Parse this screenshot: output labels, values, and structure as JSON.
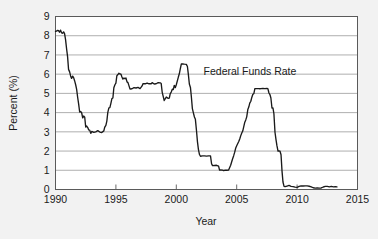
{
  "chart_data": {
    "type": "line",
    "title": "",
    "subtitle": "",
    "xlabel": "Year",
    "ylabel": "Percent (%)",
    "xlim": [
      1990,
      2015
    ],
    "ylim": [
      0,
      9
    ],
    "grid": true,
    "grid_axis": "y",
    "legend": "none",
    "annotations": [
      {
        "text": "Federal Funds Rate",
        "x": 2006.1,
        "y": 5.95
      }
    ],
    "xticks": [
      1990,
      1995,
      2000,
      2005,
      2010,
      2015
    ],
    "xtick_labels": [
      "1990",
      "1995",
      "2000",
      "2005",
      "2010",
      "2015"
    ],
    "yticks": [
      0,
      1,
      2,
      3,
      4,
      5,
      6,
      7,
      8,
      9
    ],
    "ytick_labels": [
      "0",
      "1",
      "2",
      "3",
      "4",
      "5",
      "6",
      "7",
      "8",
      "9"
    ],
    "series": [
      {
        "name": "Federal Funds Rate",
        "color": "#1a1a1a",
        "x": [
          1990.0,
          1990.08,
          1990.17,
          1990.25,
          1990.33,
          1990.42,
          1990.5,
          1990.58,
          1990.67,
          1990.75,
          1990.83,
          1990.92,
          1991.0,
          1991.08,
          1991.17,
          1991.25,
          1991.33,
          1991.42,
          1991.5,
          1991.58,
          1991.67,
          1991.75,
          1991.83,
          1991.92,
          1992.0,
          1992.08,
          1992.17,
          1992.25,
          1992.33,
          1992.42,
          1992.5,
          1992.58,
          1992.67,
          1992.75,
          1992.83,
          1992.92,
          1993.0,
          1993.17,
          1993.33,
          1993.5,
          1993.67,
          1993.83,
          1994.0,
          1994.08,
          1994.17,
          1994.25,
          1994.33,
          1994.42,
          1994.5,
          1994.58,
          1994.67,
          1994.75,
          1994.83,
          1994.92,
          1995.0,
          1995.08,
          1995.17,
          1995.25,
          1995.33,
          1995.42,
          1995.5,
          1995.58,
          1995.67,
          1995.75,
          1995.83,
          1995.92,
          1996.0,
          1996.17,
          1996.33,
          1996.5,
          1996.67,
          1996.83,
          1997.0,
          1997.17,
          1997.25,
          1997.42,
          1997.58,
          1997.75,
          1997.92,
          1998.0,
          1998.17,
          1998.33,
          1998.5,
          1998.67,
          1998.75,
          1998.83,
          1998.92,
          1999.0,
          1999.17,
          1999.33,
          1999.42,
          1999.5,
          1999.58,
          1999.67,
          1999.75,
          1999.83,
          1999.92,
          2000.0,
          2000.17,
          2000.25,
          2000.33,
          2000.42,
          2000.5,
          2000.67,
          2000.83,
          2000.92,
          2001.0,
          2001.08,
          2001.17,
          2001.25,
          2001.33,
          2001.42,
          2001.5,
          2001.58,
          2001.67,
          2001.75,
          2001.83,
          2001.92,
          2002.0,
          2002.17,
          2002.33,
          2002.5,
          2002.67,
          2002.83,
          2002.92,
          2003.0,
          2003.17,
          2003.33,
          2003.5,
          2003.58,
          2003.67,
          2003.83,
          2003.92,
          2004.0,
          2004.17,
          2004.33,
          2004.5,
          2004.58,
          2004.67,
          2004.75,
          2004.83,
          2004.92,
          2005.0,
          2005.17,
          2005.25,
          2005.33,
          2005.42,
          2005.5,
          2005.58,
          2005.67,
          2005.75,
          2005.83,
          2005.92,
          2006.0,
          2006.08,
          2006.17,
          2006.25,
          2006.33,
          2006.42,
          2006.5,
          2006.58,
          2006.67,
          2006.83,
          2006.92,
          2007.0,
          2007.17,
          2007.33,
          2007.5,
          2007.58,
          2007.67,
          2007.75,
          2007.83,
          2007.92,
          2008.0,
          2008.08,
          2008.17,
          2008.25,
          2008.33,
          2008.42,
          2008.5,
          2008.58,
          2008.67,
          2008.75,
          2008.83,
          2008.92,
          2009.0,
          2009.17,
          2009.33,
          2009.5,
          2009.67,
          2009.83,
          2010.0,
          2010.17,
          2010.33,
          2010.5,
          2010.67,
          2010.83,
          2011.0,
          2011.17,
          2011.33,
          2011.5,
          2011.67,
          2011.83,
          2012.0,
          2012.17,
          2012.33,
          2012.5,
          2012.67,
          2012.83,
          2013.0,
          2013.17,
          2013.3
        ],
        "y": [
          8.23,
          8.24,
          8.28,
          8.26,
          8.18,
          8.29,
          8.15,
          8.13,
          8.2,
          8.11,
          7.81,
          7.31,
          6.91,
          6.25,
          6.12,
          5.91,
          5.78,
          5.9,
          5.82,
          5.66,
          5.45,
          5.21,
          4.81,
          4.43,
          4.03,
          4.06,
          3.98,
          3.73,
          3.82,
          3.76,
          3.25,
          3.3,
          3.22,
          3.1,
          3.09,
          2.92,
          3.02,
          2.97,
          3.0,
          3.06,
          2.99,
          2.96,
          3.05,
          3.25,
          3.34,
          3.56,
          4.01,
          4.25,
          4.26,
          4.47,
          4.73,
          4.76,
          5.29,
          5.45,
          5.53,
          5.92,
          5.98,
          6.05,
          6.01,
          6.0,
          5.85,
          5.74,
          5.8,
          5.76,
          5.8,
          5.6,
          5.56,
          5.22,
          5.24,
          5.3,
          5.28,
          5.31,
          5.25,
          5.39,
          5.51,
          5.5,
          5.54,
          5.5,
          5.5,
          5.56,
          5.49,
          5.5,
          5.56,
          5.55,
          5.51,
          5.07,
          4.83,
          4.63,
          4.81,
          4.74,
          4.75,
          4.99,
          5.07,
          5.22,
          5.2,
          5.42,
          5.3,
          5.45,
          5.85,
          6.02,
          6.27,
          6.53,
          6.54,
          6.52,
          6.51,
          6.4,
          5.98,
          5.49,
          5.31,
          4.8,
          4.21,
          3.97,
          3.77,
          3.65,
          3.07,
          2.49,
          2.09,
          1.82,
          1.73,
          1.75,
          1.75,
          1.74,
          1.75,
          1.75,
          1.34,
          1.24,
          1.25,
          1.26,
          1.22,
          1.01,
          1.02,
          1.01,
          0.98,
          1.0,
          1.0,
          1.01,
          1.26,
          1.43,
          1.61,
          1.76,
          1.93,
          2.16,
          2.28,
          2.5,
          2.63,
          2.79,
          2.94,
          3.04,
          3.26,
          3.5,
          3.62,
          3.78,
          4.16,
          4.29,
          4.49,
          4.59,
          4.79,
          4.94,
          4.99,
          5.24,
          5.25,
          5.25,
          5.25,
          5.24,
          5.25,
          5.26,
          5.25,
          5.26,
          5.25,
          5.02,
          4.94,
          4.76,
          4.24,
          4.25,
          3.94,
          2.98,
          2.61,
          2.28,
          2.0,
          2.01,
          2.0,
          1.81,
          0.97,
          0.39,
          0.16,
          0.15,
          0.18,
          0.21,
          0.16,
          0.15,
          0.12,
          0.11,
          0.16,
          0.19,
          0.18,
          0.19,
          0.19,
          0.17,
          0.14,
          0.09,
          0.07,
          0.08,
          0.07,
          0.08,
          0.13,
          0.16,
          0.16,
          0.14,
          0.16,
          0.14,
          0.15,
          0.14
        ]
      }
    ]
  },
  "axes": {
    "x_title": "Year",
    "y_title": "Percent (%)"
  }
}
